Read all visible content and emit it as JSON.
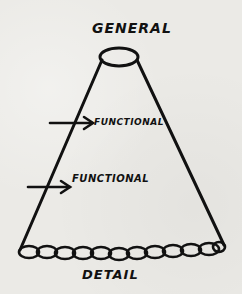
{
  "diagram": {
    "type": "hand-drawn cone / funnel",
    "labels": {
      "top": "GENERAL",
      "middle_upper": "FUNCTIONAL",
      "middle_lower": "FUNCTIONAL",
      "bottom": "DETAIL"
    },
    "arrows": [
      {
        "points_to": "left edge of cone",
        "label": "FUNCTIONAL"
      },
      {
        "points_to": "left edge of cone",
        "label": "FUNCTIONAL"
      }
    ],
    "colors": {
      "ink": "#111111",
      "paper": "#ebeae6"
    }
  }
}
